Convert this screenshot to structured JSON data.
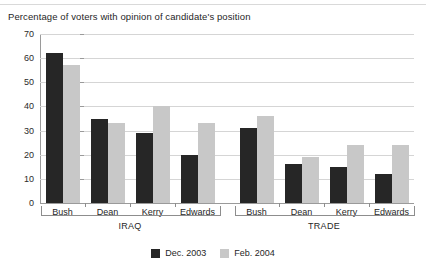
{
  "chart_data": {
    "type": "bar",
    "title": "Percentage of voters with opinion of candidate's position",
    "xlabel": "",
    "ylabel": "",
    "ylim": [
      0,
      70
    ],
    "ytick_step": 10,
    "yticks": [
      0,
      10,
      20,
      30,
      40,
      50,
      60,
      70
    ],
    "grid": true,
    "legend_position": "bottom-center",
    "groups": [
      {
        "name": "IRAQ",
        "categories": [
          "Bush",
          "Dean",
          "Kerry",
          "Edwards"
        ]
      },
      {
        "name": "TRADE",
        "categories": [
          "Bush",
          "Dean",
          "Kerry",
          "Edwards"
        ]
      }
    ],
    "categories": [
      "IRAQ - Bush",
      "IRAQ - Dean",
      "IRAQ - Kerry",
      "IRAQ - Edwards",
      "TRADE - Bush",
      "TRADE - Dean",
      "TRADE - Kerry",
      "TRADE - Edwards"
    ],
    "series": [
      {
        "name": "Dec. 2003",
        "color": "#262626",
        "values": [
          62,
          35,
          29,
          20,
          31,
          16,
          15,
          12
        ]
      },
      {
        "name": "Feb. 2004",
        "color": "#c8c8c8",
        "values": [
          57,
          33,
          40,
          33,
          36,
          19,
          24,
          24
        ]
      }
    ]
  },
  "legend": {
    "items": [
      {
        "label": "Dec. 2003",
        "color": "#262626"
      },
      {
        "label": "Feb. 2004",
        "color": "#c8c8c8"
      }
    ]
  }
}
